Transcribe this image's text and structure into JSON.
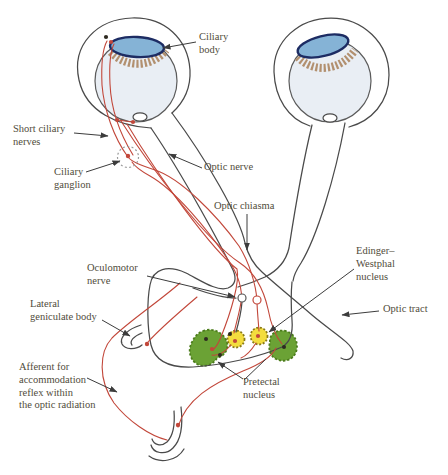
{
  "labels": {
    "ciliary_body": {
      "lines": [
        "Ciliary",
        "body"
      ]
    },
    "short_ciliary_nerves": {
      "lines": [
        "Short ciliary",
        "nerves"
      ]
    },
    "ciliary_ganglion": {
      "lines": [
        "Ciliary",
        "ganglion"
      ]
    },
    "optic_nerve": {
      "lines": [
        "Optic nerve"
      ]
    },
    "optic_chiasma": {
      "lines": [
        "Optic chiasma"
      ]
    },
    "oculomotor_nerve": {
      "lines": [
        "Oculomotor",
        "nerve"
      ]
    },
    "edinger_westphal_nucleus": {
      "lines": [
        "Edinger–",
        "Westphal",
        "nucleus"
      ]
    },
    "optic_tract": {
      "lines": [
        "Optic tract"
      ]
    },
    "lateral_geniculate_body": {
      "lines": [
        "Lateral",
        "geniculate body"
      ]
    },
    "afferent_accommodation": {
      "lines": [
        "Afferent for",
        "accommodation",
        "reflex within",
        "the optic radiation"
      ]
    },
    "pretectal_nucleus": {
      "lines": [
        "Pretectal",
        "nucleus"
      ]
    }
  },
  "colors": {
    "background": "#ffffff",
    "pathway_red": "#c2473a",
    "outline_dark": "#4a4a4a",
    "leader_line": "#3c3c3c",
    "label_text": "#514c3b",
    "eyeball_fill": "#e9eef4",
    "lens_blue": "#85b3d6",
    "lens_outline_navy": "#1d2c63",
    "ciliary_body_brown": "#b2906f",
    "ew_nucleus_yellow": "#f3dd3e",
    "ew_nucleus_border": "#8a7a18",
    "pretectal_green": "#6ba235",
    "pretectal_border": "#4c7c1c",
    "synapse_dot_dark": "#2e2a20"
  }
}
